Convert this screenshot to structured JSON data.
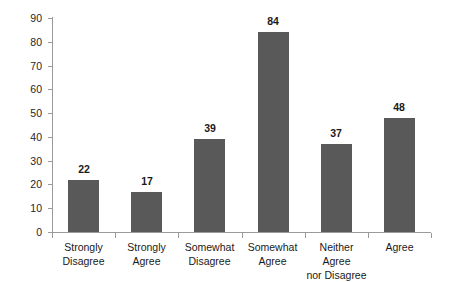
{
  "chart_data": {
    "type": "bar",
    "title": "",
    "subtitle": "",
    "xlabel": "",
    "ylabel": "",
    "ylim": [
      0,
      90
    ],
    "ytick_step": 10,
    "grid": false,
    "legend": false,
    "bar_color": "#595959",
    "axis_color": "#9a9a9a",
    "text_color": "#1a1a1a",
    "categories": [
      "Strongly\nDisagree",
      "Strongly Agree",
      "Somewhat\nDisagree",
      "Somewhat\nAgree",
      "Neither Agree\nnor Disagree",
      "Agree"
    ],
    "values": [
      22,
      17,
      39,
      84,
      37,
      48
    ],
    "value_labels": [
      "22",
      "17",
      "39",
      "84",
      "37",
      "48"
    ],
    "ytick_labels": [
      "0",
      "10",
      "20",
      "30",
      "40",
      "50",
      "60",
      "70",
      "80",
      "90"
    ]
  }
}
